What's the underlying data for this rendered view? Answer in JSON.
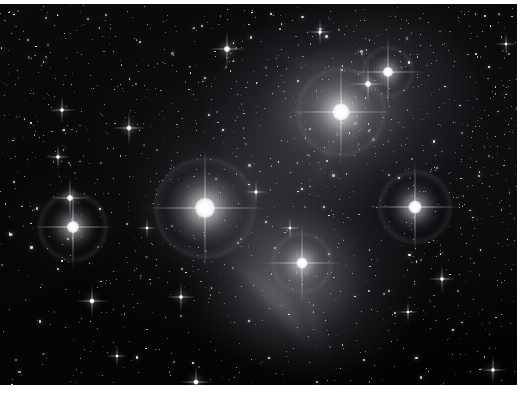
{
  "image": {
    "kind": "astrophotograph",
    "subject": "Pleiades open star cluster (M45) with surrounding reflection nebulosity",
    "caption": "",
    "width_px": 531,
    "height_px": 399,
    "rendering": "monochrome grayscale",
    "border": {
      "top_margin_px": 4,
      "bottom_margin_px": 14,
      "right_margin_px": 14,
      "margin_color": "#ffffff"
    },
    "palette": {
      "sky_black": "#020203",
      "sky_dark": "#0a0a0c",
      "nebula_gray": "#7e8086",
      "nebula_bright": "#babcc2",
      "star_white": "#ffffff",
      "halo_gray": "#9699a0",
      "margin_white": "#ffffff"
    },
    "texture": {
      "scanlines": "vertical CCD column striping",
      "grid": "faint horizontal seam near mid-frame"
    }
  },
  "bright_stars": [
    {
      "name": "star-alcyone",
      "x": 205,
      "y": 208,
      "core": 20,
      "glow": 70,
      "halo": 98,
      "spike": 120,
      "brightness": 1.0
    },
    {
      "name": "star-atlas",
      "x": 341,
      "y": 112,
      "core": 17,
      "glow": 62,
      "halo": 86,
      "spike": 104,
      "brightness": 0.96
    },
    {
      "name": "star-maia",
      "x": 415,
      "y": 207,
      "core": 13,
      "glow": 48,
      "halo": 70,
      "spike": 92,
      "brightness": 0.88
    },
    {
      "name": "star-electra",
      "x": 73,
      "y": 227,
      "core": 12,
      "glow": 44,
      "halo": 66,
      "spike": 84,
      "brightness": 0.86
    },
    {
      "name": "star-merope",
      "x": 302,
      "y": 263,
      "core": 11,
      "glow": 42,
      "halo": 58,
      "spike": 80,
      "brightness": 0.84
    },
    {
      "name": "star-taygeta",
      "x": 388,
      "y": 72,
      "core": 10,
      "glow": 34,
      "halo": 48,
      "spike": 72,
      "brightness": 0.8
    },
    {
      "name": "star-pleione",
      "x": 368,
      "y": 84,
      "core": 6,
      "glow": 18,
      "halo": 0,
      "spike": 40,
      "brightness": 0.62
    },
    {
      "name": "star-asterope",
      "x": 70,
      "y": 198,
      "core": 6,
      "glow": 20,
      "halo": 0,
      "spike": 42,
      "brightness": 0.64
    },
    {
      "name": "star-celaeno",
      "x": 227,
      "y": 49,
      "core": 6,
      "glow": 17,
      "halo": 0,
      "spike": 38,
      "brightness": 0.6
    },
    {
      "name": "star-field-a",
      "x": 129,
      "y": 128,
      "core": 5,
      "glow": 15,
      "halo": 0,
      "spike": 34,
      "brightness": 0.56
    },
    {
      "name": "star-field-b",
      "x": 62,
      "y": 110,
      "core": 4,
      "glow": 12,
      "halo": 0,
      "spike": 28,
      "brightness": 0.5
    },
    {
      "name": "star-field-c",
      "x": 92,
      "y": 301,
      "core": 5,
      "glow": 14,
      "halo": 0,
      "spike": 32,
      "brightness": 0.54
    },
    {
      "name": "star-field-d",
      "x": 181,
      "y": 297,
      "core": 4,
      "glow": 13,
      "halo": 0,
      "spike": 30,
      "brightness": 0.52
    },
    {
      "name": "star-field-e",
      "x": 196,
      "y": 382,
      "core": 5,
      "glow": 15,
      "halo": 0,
      "spike": 32,
      "brightness": 0.55
    },
    {
      "name": "star-field-f",
      "x": 442,
      "y": 279,
      "core": 4,
      "glow": 12,
      "halo": 0,
      "spike": 28,
      "brightness": 0.5
    },
    {
      "name": "star-field-g",
      "x": 493,
      "y": 370,
      "core": 4,
      "glow": 12,
      "halo": 0,
      "spike": 28,
      "brightness": 0.5
    },
    {
      "name": "star-field-h",
      "x": 58,
      "y": 157,
      "core": 4,
      "glow": 11,
      "halo": 0,
      "spike": 26,
      "brightness": 0.48
    },
    {
      "name": "star-field-i",
      "x": 320,
      "y": 32,
      "core": 4,
      "glow": 11,
      "halo": 0,
      "spike": 26,
      "brightness": 0.48
    },
    {
      "name": "star-field-j",
      "x": 256,
      "y": 192,
      "core": 4,
      "glow": 10,
      "halo": 0,
      "spike": 24,
      "brightness": 0.46
    },
    {
      "name": "star-field-k",
      "x": 408,
      "y": 312,
      "core": 3,
      "glow": 9,
      "halo": 0,
      "spike": 22,
      "brightness": 0.44
    },
    {
      "name": "star-field-l",
      "x": 147,
      "y": 228,
      "core": 3,
      "glow": 9,
      "halo": 0,
      "spike": 22,
      "brightness": 0.44
    },
    {
      "name": "star-field-m",
      "x": 290,
      "y": 228,
      "core": 3,
      "glow": 9,
      "halo": 0,
      "spike": 22,
      "brightness": 0.44
    },
    {
      "name": "star-field-n",
      "x": 506,
      "y": 44,
      "core": 3,
      "glow": 9,
      "halo": 0,
      "spike": 22,
      "brightness": 0.44
    },
    {
      "name": "star-field-o",
      "x": 117,
      "y": 356,
      "core": 3,
      "glow": 9,
      "halo": 0,
      "spike": 20,
      "brightness": 0.42
    }
  ],
  "nebula_veils": [
    {
      "name": "veil-merope",
      "x": 288,
      "y": 282,
      "w": 170,
      "h": 150,
      "opacity": 0.34,
      "color": "#aeb0b6"
    },
    {
      "name": "veil-alcyone",
      "x": 206,
      "y": 210,
      "w": 150,
      "h": 140,
      "opacity": 0.22,
      "color": "#8a8c92"
    },
    {
      "name": "veil-atlas",
      "x": 336,
      "y": 120,
      "w": 150,
      "h": 135,
      "opacity": 0.3,
      "color": "#a2a4aa"
    },
    {
      "name": "veil-central",
      "x": 270,
      "y": 190,
      "w": 230,
      "h": 200,
      "opacity": 0.16,
      "color": "#6e7076"
    },
    {
      "name": "veil-upper",
      "x": 400,
      "y": 60,
      "w": 190,
      "h": 150,
      "opacity": 0.14,
      "color": "#66686e"
    },
    {
      "name": "veil-lower",
      "x": 330,
      "y": 330,
      "w": 180,
      "h": 110,
      "opacity": 0.12,
      "color": "#5e6066"
    },
    {
      "name": "veil-left",
      "x": 60,
      "y": 225,
      "w": 120,
      "h": 110,
      "opacity": 0.12,
      "color": "#5a5c62"
    }
  ],
  "nebula_streaks": [
    {
      "name": "streak-ic349-1",
      "x": 276,
      "y": 300,
      "w": 120,
      "h": 8,
      "rot": 58,
      "opacity": 0.4
    },
    {
      "name": "streak-ic349-2",
      "x": 292,
      "y": 312,
      "w": 108,
      "h": 7,
      "rot": 62,
      "opacity": 0.34
    },
    {
      "name": "streak-ic349-3",
      "x": 262,
      "y": 292,
      "w": 96,
      "h": 6,
      "rot": 54,
      "opacity": 0.3
    },
    {
      "name": "streak-ic349-4",
      "x": 312,
      "y": 318,
      "w": 110,
      "h": 7,
      "rot": 70,
      "opacity": 0.28
    },
    {
      "name": "streak-ic349-5",
      "x": 250,
      "y": 278,
      "w": 84,
      "h": 6,
      "rot": 48,
      "opacity": 0.24
    },
    {
      "name": "streak-atlas-1",
      "x": 330,
      "y": 150,
      "w": 100,
      "h": 7,
      "rot": 115,
      "opacity": 0.24
    },
    {
      "name": "streak-atlas-2",
      "x": 352,
      "y": 140,
      "w": 86,
      "h": 6,
      "rot": 100,
      "opacity": 0.2
    },
    {
      "name": "streak-upper-1",
      "x": 300,
      "y": 62,
      "w": 96,
      "h": 6,
      "rot": 20,
      "opacity": 0.16
    }
  ],
  "accessibility": {
    "alt_text": "Black and white astronomical photograph of the Pleiades star cluster. Several very bright stars show four point diffraction spikes and circular halos, embedded in wispy reflection nebulosity, against a dense field of thousands of faint stars. A bright white band runs down the right edge of the frame."
  }
}
